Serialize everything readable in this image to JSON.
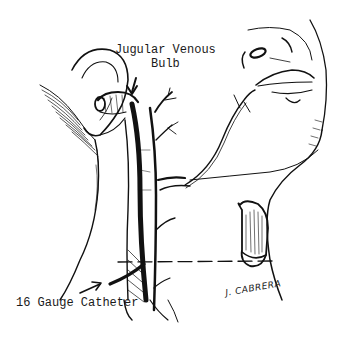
{
  "figure": {
    "type": "medical-illustration",
    "labels": {
      "jugular_bulb_line1": "Jugular Venous",
      "jugular_bulb_line2": "Bulb",
      "catheter": "16 Gauge Catheter"
    },
    "signature": "J. CABRERA",
    "colors": {
      "ink": "#111111",
      "background": "#ffffff"
    }
  }
}
